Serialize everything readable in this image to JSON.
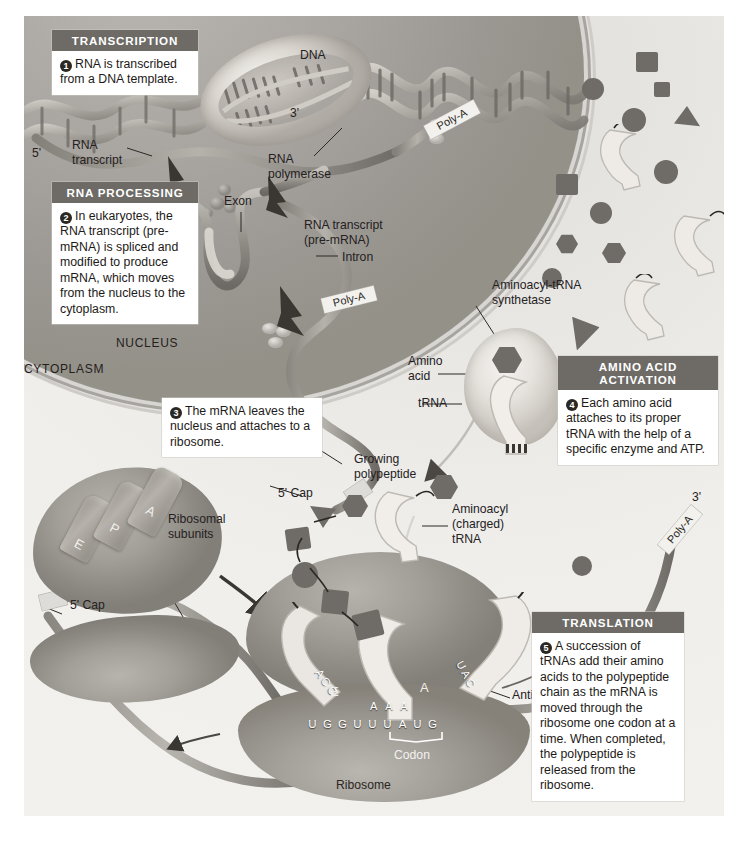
{
  "figure": {
    "compartments": {
      "nucleus": "NUCLEUS",
      "cytoplasm": "CYTOPLASM"
    }
  },
  "colors": {
    "plate_background": "#eceae6",
    "callout_header": "#6e6b66",
    "callout_body": "#ffffff",
    "nucleus_fill": "#a9a6a1",
    "ribosome_fill": "#9d9993",
    "amino_acid": "#6f6b66",
    "text": "#25211e"
  },
  "callouts": [
    {
      "id": "transcription",
      "header": "TRANSCRIPTION",
      "number": "1",
      "body": "RNA is transcribed from a DNA template."
    },
    {
      "id": "rna-processing",
      "header": "RNA PROCESSING",
      "number": "2",
      "body": "In eukaryotes, the RNA transcript (pre-mRNA) is spliced and modified to produce mRNA, which moves from the nucleus to the cytoplasm."
    },
    {
      "id": "mrna-export",
      "header": "",
      "number": "3",
      "body": "The mRNA leaves the nucleus and attaches to a ribosome."
    },
    {
      "id": "amino-acid-activation",
      "header": "AMINO ACID ACTIVATION",
      "number": "4",
      "body": "Each amino acid attaches to its proper tRNA with the help of a specific enzyme and ATP."
    },
    {
      "id": "translation",
      "header": "TRANSLATION",
      "number": "5",
      "body": "A succession of tRNAs add their amino acids to the polypeptide chain as the mRNA is moved through the ribosome one codon at a time. When completed, the polypeptide is released from the ribosome."
    }
  ],
  "labels": {
    "dna": "DNA",
    "three_prime_polymerase": "3'",
    "rna_polymerase": "RNA\npolymerase",
    "rna_transcript": "RNA\ntranscript",
    "five_prime": "5'",
    "exon": "Exon",
    "intron": "Intron",
    "rna_transcript_pre_mrna": "RNA transcript\n(pre-mRNA)",
    "nucleus": "NUCLEUS",
    "cytoplasm": "CYTOPLASM",
    "poly_a_1": "Poly-A",
    "poly_a_2": "Poly-A",
    "poly_a_3": "Poly-A",
    "three_prime_mrna": "3'",
    "aminoacyl_trna_synthetase": "Aminoacyl-tRNA\nsynthetase",
    "amino_acid": "Amino\nacid",
    "trna": "tRNA",
    "mrna": "mRNA",
    "five_cap_1": "5' Cap",
    "five_cap_2": "5' Cap",
    "growing_polypeptide": "Growing\npolypeptide",
    "aminoacyl_charged_trna": "Aminoacyl\n(charged)\ntRNA",
    "ribosomal_subunits": "Ribosomal\nsubunits",
    "anticodon": "Anticodon",
    "codon": "Codon",
    "ribosome": "Ribosome"
  },
  "ribosome_sites": {
    "e_site": "E",
    "p_site": "P",
    "a_site": "A"
  },
  "mrna_sequence": [
    "U",
    "G",
    "G",
    "U",
    "U",
    "U",
    "A",
    "U",
    "G"
  ],
  "trna_anticodons": [
    {
      "site": "E",
      "bases": "ACC"
    },
    {
      "site": "P",
      "bases": "AAA"
    },
    {
      "site": "A",
      "bases": "UAC"
    }
  ],
  "site_letters_in_ribosome": [
    "E",
    "A"
  ]
}
